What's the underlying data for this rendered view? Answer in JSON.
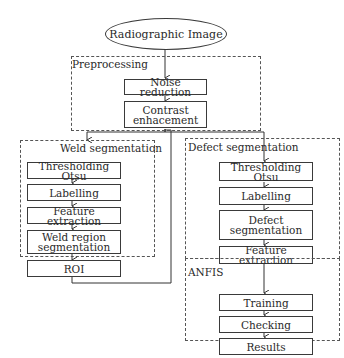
{
  "diagram": {
    "start": "Radiographic Image",
    "groups": {
      "preprocessing": "Preprocessing",
      "weld": "Weld segmentation",
      "defect": "Defect segmentation",
      "anfis": "ANFIS"
    },
    "nodes": {
      "noise": "Noise reduction",
      "contrast_l1": "Contrast",
      "contrast_l2": "enhacement",
      "weld_thresh": "Thresholding Otsu",
      "weld_label": "Labelling",
      "weld_feat": "Feature extraction",
      "weld_region_l1": "Weld region",
      "weld_region_l2": "segmentation",
      "roi": "ROI",
      "def_thresh": "Thresholding Otsu",
      "def_label": "Labelling",
      "def_seg_l1": "Defect",
      "def_seg_l2": "segmentation",
      "def_feat": "Feature extraction",
      "training": "Training",
      "checking": "Checking",
      "results": "Results"
    }
  }
}
